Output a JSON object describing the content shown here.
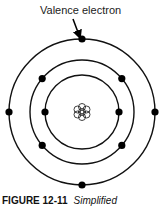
{
  "diagram": {
    "label": "Valence electron",
    "caption_number": "FIGURE 12-11",
    "caption_text": "Simplified",
    "center": [
      82,
      112
    ],
    "shells": [
      {
        "radius": 37,
        "electrons_deg": [
          0,
          180
        ]
      },
      {
        "radius": 52,
        "electrons_deg": [
          40,
          140,
          220,
          320
        ]
      },
      {
        "radius": 73,
        "electrons_deg": [
          0,
          90,
          180,
          270
        ]
      }
    ],
    "colors": {
      "line": "#111111",
      "electron": "#000000"
    }
  }
}
